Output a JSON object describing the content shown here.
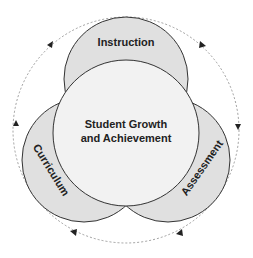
{
  "diagram": {
    "center_label_line1": "Student Growth",
    "center_label_line2": "and Achievement",
    "top_label": "Instruction",
    "left_label": "Curriculum",
    "right_label": "Assessment"
  },
  "colors": {
    "outer_circle_fill": "#e0e0e0",
    "center_circle_fill": "#f2f2f2",
    "stroke": "#333333",
    "dashed_cycle": "#888888"
  }
}
